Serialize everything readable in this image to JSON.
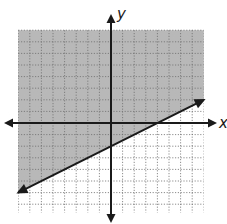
{
  "chart_data": {
    "type": "line",
    "title": "",
    "xlabel": "x",
    "ylabel": "y",
    "xlim": [
      -8,
      8
    ],
    "ylim": [
      -8,
      8
    ],
    "grid": true,
    "grid_step": 1,
    "series": [
      {
        "name": "boundary",
        "equation": "y = 1/2 x - 2",
        "slope": 0.5,
        "intercept": -2,
        "x": [
          -8,
          8
        ],
        "y": [
          -6,
          2
        ],
        "line_style": "solid",
        "arrows": "both"
      }
    ],
    "shaded_region": "above line",
    "inequality": "y >= 1/2 x - 2"
  },
  "axes": {
    "x_label": "x",
    "y_label": "y"
  },
  "colors": {
    "shade": "#b8b8b8",
    "grid": "#6e6e6e",
    "axis": "#1a1a1a",
    "background": "#ffffff"
  }
}
